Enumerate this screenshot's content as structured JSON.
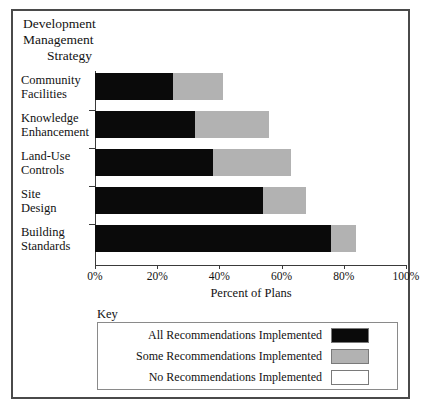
{
  "chart_data": {
    "type": "bar",
    "orientation": "horizontal",
    "stacked": true,
    "title": "Development Management Strategy",
    "title_lines": [
      "Development",
      "Management",
      "Strategy"
    ],
    "xlabel": "Percent of Plans",
    "ylabel": "",
    "xlim": [
      0,
      100
    ],
    "xticks": [
      0,
      20,
      40,
      60,
      80,
      100
    ],
    "xtick_labels": [
      "0%",
      "20%",
      "40%",
      "60%",
      "80%",
      "100%"
    ],
    "grid": false,
    "legend_position": "below-plot",
    "legend_title": "Key",
    "categories": [
      "Community Facilities",
      "Knowledge Enhancement",
      "Land-Use Controls",
      "Site Design",
      "Building Standards"
    ],
    "category_lines": [
      [
        "Community",
        "Facilities"
      ],
      [
        "Knowledge",
        "Enhancement"
      ],
      [
        "Land-Use",
        "Controls"
      ],
      [
        "Site",
        "Design"
      ],
      [
        "Building",
        "Standards"
      ]
    ],
    "series": [
      {
        "name": "All Recommendations Implemented",
        "color": "#0a0a0a",
        "values": [
          25,
          32,
          38,
          54,
          76
        ]
      },
      {
        "name": "Some Recommendations Implemented",
        "color": "#b2b2b2",
        "values": [
          16,
          24,
          25,
          14,
          8
        ]
      },
      {
        "name": "No Recommendations Implemented",
        "color": "#ffffff",
        "values": [
          59,
          44,
          37,
          32,
          16
        ]
      }
    ],
    "cumulative_boundaries": [
      [
        25,
        41
      ],
      [
        32,
        56
      ],
      [
        38,
        63
      ],
      [
        54,
        68
      ],
      [
        76,
        84
      ]
    ]
  },
  "legend": {
    "title": "Key",
    "entries": [
      {
        "label": "All Recommendations Implemented",
        "color": "#0a0a0a"
      },
      {
        "label": "Some Recommendations Implemented",
        "color": "#b2b2b2"
      },
      {
        "label": "No Recommendations Implemented",
        "color": "#ffffff"
      }
    ]
  },
  "axis": {
    "x_title": "Percent of Plans",
    "ticks": [
      "0%",
      "20%",
      "40%",
      "60%",
      "80%",
      "100%"
    ]
  },
  "title": {
    "line1": "Development",
    "line2": "Management",
    "line3": "Strategy"
  },
  "categories": {
    "c0l1": "Community",
    "c0l2": "Facilities",
    "c1l1": "Knowledge",
    "c1l2": "Enhancement",
    "c2l1": "Land-Use",
    "c2l2": "Controls",
    "c3l1": "Site",
    "c3l2": "Design",
    "c4l1": "Building",
    "c4l2": "Standards"
  }
}
